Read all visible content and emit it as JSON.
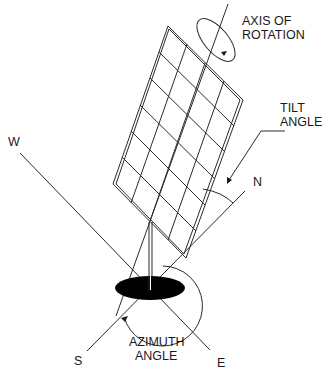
{
  "diagram": {
    "labels": {
      "axis_of_rotation": [
        "AXIS OF",
        "ROTATION"
      ],
      "tilt_angle": [
        "TILT",
        "ANGLE"
      ],
      "azimuth_angle": [
        "AZIMUTH",
        "ANGLE"
      ],
      "north": "N",
      "south": "S",
      "east": "E",
      "west": "W"
    },
    "panel": {
      "rows": 6,
      "columns": 4
    },
    "colors": {
      "line": "#2a2a2a",
      "base": "#000000",
      "background": "#ffffff"
    }
  }
}
